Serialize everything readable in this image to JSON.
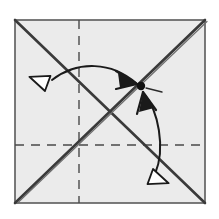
{
  "figure": {
    "title": "Origami fold step diagram",
    "canvas": {
      "width": 219,
      "height": 219,
      "background": "#ffffff"
    }
  },
  "colors": {
    "paper_fill": "#ebebeb",
    "paper_edge": "#5a5a5a",
    "crease_solid": "#3a3a3a",
    "crease_dashed": "#4a4a4a",
    "arrow_stroke": "#1a1a1a",
    "arrow_head_fill": "#ffffff",
    "point_marker": "#111111"
  },
  "paper": {
    "label": "square-sheet",
    "x": 15,
    "y": 20,
    "width": 190,
    "height": 183,
    "stroke_width": 1.6
  },
  "creases": [
    {
      "name": "diagonal-tl-br",
      "style": "solid",
      "x1": 15,
      "y1": 20,
      "x2": 205,
      "y2": 203,
      "stroke_width": 2.6
    },
    {
      "name": "diagonal-bl-tr",
      "style": "solid-double",
      "x1": 15,
      "y1": 203,
      "x2": 205,
      "y2": 20,
      "stroke_width": 2.6
    },
    {
      "name": "vertical-center-crease",
      "style": "dashed",
      "x1": 79,
      "y1": 20,
      "x2": 79,
      "y2": 203,
      "stroke_width": 1.4,
      "dash": "9 7"
    },
    {
      "name": "horizontal-center-crease",
      "style": "dashed",
      "x1": 15,
      "y1": 145,
      "x2": 205,
      "y2": 145,
      "stroke_width": 1.4,
      "dash": "9 7"
    }
  ],
  "target_point": {
    "name": "fold-target-point",
    "x": 141,
    "y": 86,
    "radius": 4.2
  },
  "arrows": [
    {
      "name": "upper-fold-arrow",
      "description": "Curved arrow sweeping from the left corner region up and over to the target point",
      "path": "M 52 80 C 78 60, 112 62, 136 83",
      "stroke_width": 2.0,
      "head": {
        "name": "solid-arrowhead-to-point",
        "kind": "filled-barb",
        "x": 137,
        "y": 84,
        "angle": 40
      },
      "tail_marker": {
        "name": "hollow-triangle-left",
        "kind": "open-triangle",
        "x": 41,
        "y": 81,
        "angle": 200,
        "size": 13
      }
    },
    {
      "name": "lower-fold-arrow",
      "description": "Curved arrow sweeping from the bottom-right corner region up to the target point",
      "path": "M 155 174 C 166 148, 158 110, 144 94",
      "stroke_width": 2.0,
      "head": {
        "name": "solid-arrowhead-to-point-lower",
        "kind": "filled-barb",
        "x": 143,
        "y": 92,
        "angle": -58
      },
      "tail_marker": {
        "name": "hollow-triangle-bottom",
        "kind": "open-triangle",
        "x": 157,
        "y": 179,
        "angle": 20,
        "size": 13
      }
    }
  ],
  "tick_marks": [
    {
      "name": "point-tick-right",
      "x1": 146,
      "y1": 88,
      "x2": 162,
      "y2": 92
    }
  ]
}
